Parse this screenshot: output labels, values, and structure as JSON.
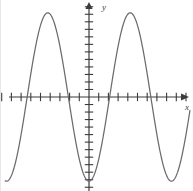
{
  "figure": {
    "background_color": "#ffffff",
    "curve_color": "#6b6b6b",
    "axis_color": "#3b3b3b",
    "x_axis_label": "x",
    "y_axis_label": "y"
  },
  "chart_data": {
    "type": "line",
    "title": "",
    "subtitle": "",
    "xlabel": "x",
    "ylabel": "y",
    "legend": [],
    "legend_position": "none",
    "grid": false,
    "axis_style": "cartesian-cross-with-arrows",
    "x_axis": {
      "min": -9.0,
      "max": 10.5,
      "tick_step": 1,
      "tick_labels": [],
      "arrow": "right",
      "tick_positions": [
        -9,
        -8,
        -7,
        -6,
        -5,
        -4,
        -3,
        -2,
        -1,
        0,
        1,
        2,
        3,
        4,
        5,
        6,
        7,
        8,
        9,
        10
      ]
    },
    "y_axis": {
      "min": -13,
      "max": 13,
      "tick_step": 1,
      "tick_labels": [],
      "arrow": "up",
      "tick_positions": [
        -12,
        -11,
        -10,
        -9,
        -8,
        -7,
        -6,
        -5,
        -4,
        -3,
        -2,
        -1,
        1,
        2,
        3,
        4,
        5,
        6,
        7,
        8,
        9,
        10,
        11,
        12
      ]
    },
    "function": "y = -A*cos(2*pi*x/period)",
    "amplitude": 11.2,
    "period": 8.5,
    "phase": "minimum at x = 0",
    "x_intercepts": [
      -7.1,
      -3.5,
      0.8,
      4.7
    ],
    "maxima": [
      {
        "x": -1.55,
        "y": 11.2
      },
      {
        "x": 6.95,
        "y": 11.2
      }
    ],
    "minima": [
      {
        "x": -5.6,
        "y": -11.2
      },
      {
        "x": 2.8,
        "y": -11.2
      }
    ],
    "series": [
      {
        "name": "curve",
        "x": [
          -9.0,
          -8.5,
          -8.0,
          -7.5,
          -7.0,
          -6.5,
          -6.0,
          -5.5,
          -5.0,
          -4.5,
          -4.0,
          -3.5,
          -3.0,
          -2.5,
          -2.0,
          -1.5,
          -1.0,
          -0.5,
          0.0,
          0.5,
          1.0,
          1.5,
          2.0,
          2.5,
          3.0,
          3.5,
          4.0,
          4.5,
          5.0,
          5.5,
          6.0,
          6.5,
          7.0,
          7.5,
          8.0,
          8.5,
          9.0,
          9.5,
          10.0
        ],
        "y": [
          -2.9,
          -6.4,
          -9.1,
          -10.8,
          -11.2,
          -10.4,
          -8.4,
          -5.6,
          -2.1,
          1.6,
          5.2,
          8.2,
          10.3,
          11.2,
          10.9,
          9.4,
          6.9,
          3.7,
          0.2,
          -3.4,
          -6.7,
          -9.3,
          -10.9,
          -11.2,
          -10.3,
          -8.3,
          -5.4,
          -1.9,
          1.8,
          5.4,
          8.4,
          10.4,
          11.2,
          10.7,
          9.0,
          6.3,
          2.8,
          -0.9,
          -4.5
        ]
      }
    ]
  }
}
